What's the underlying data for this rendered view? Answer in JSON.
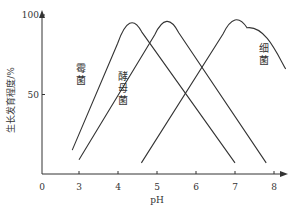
{
  "chart_data": {
    "type": "line",
    "title": "",
    "xlabel": "pH",
    "ylabel": "生长发育程度/%",
    "xlim": [
      0,
      8
    ],
    "ylim": [
      0,
      100
    ],
    "x_ticks": [
      "0",
      "3",
      "4",
      "5",
      "6",
      "7",
      "8"
    ],
    "y_ticks": [
      "50",
      "100"
    ],
    "grid": false,
    "legend": "inline labels",
    "series": [
      {
        "name": "霉菌",
        "label_chars": [
          "霉",
          "菌"
        ],
        "points": [
          [
            2.45,
            15
          ],
          [
            4.3,
            100
          ],
          [
            7.0,
            7
          ]
        ]
      },
      {
        "name": "酵母菌",
        "label_chars": [
          "酵",
          "母",
          "菌"
        ],
        "points": [
          [
            3.0,
            9
          ],
          [
            5.25,
            100
          ],
          [
            7.8,
            7
          ]
        ]
      },
      {
        "name": "细菌",
        "label_chars": [
          "细",
          "菌"
        ],
        "points": [
          [
            4.6,
            7
          ],
          [
            7.0,
            100
          ],
          [
            8.3,
            66
          ]
        ]
      }
    ],
    "line_color": "#333333"
  }
}
